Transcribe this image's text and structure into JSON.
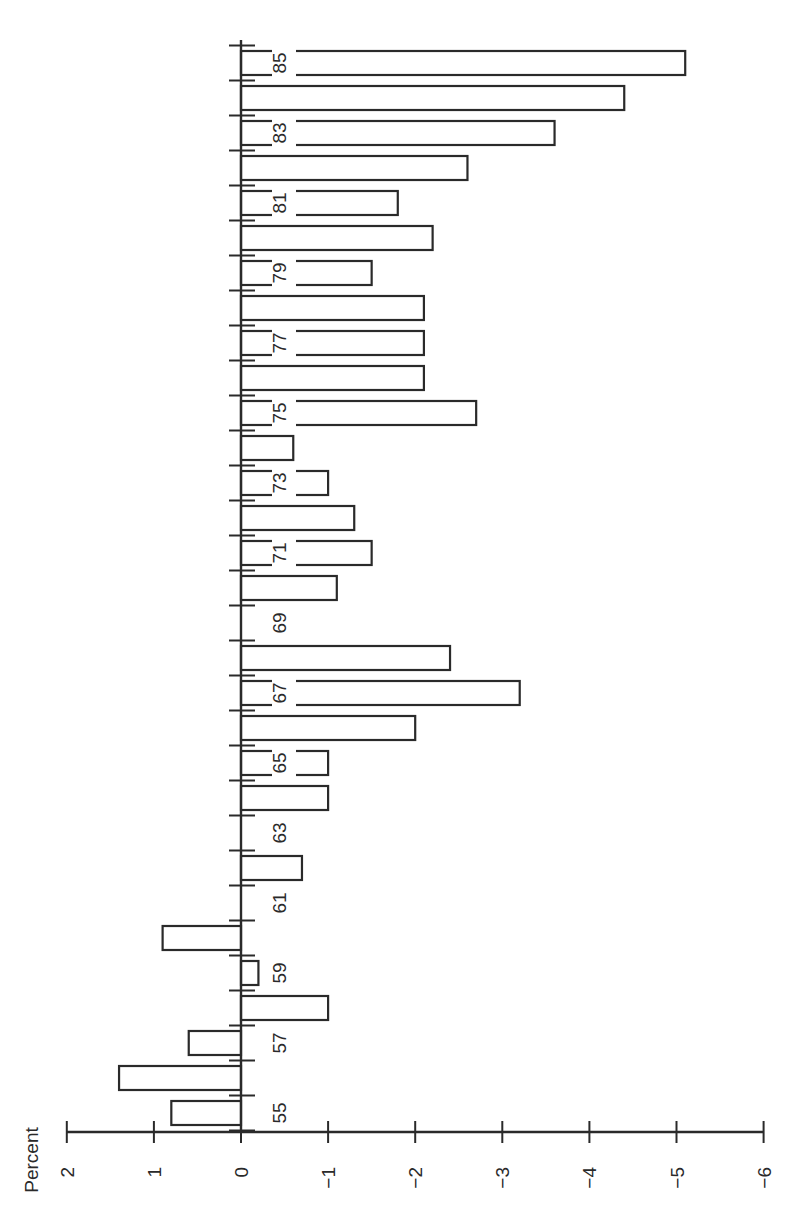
{
  "chart_data": {
    "type": "bar",
    "orientation": "horizontal (page rotated 90°)",
    "title": "",
    "ylabel": "Percent",
    "xlabel": "",
    "ylim": [
      2,
      -6
    ],
    "value_ticks": [
      2,
      1,
      0,
      -1,
      -2,
      -3,
      -4,
      -5,
      -6
    ],
    "value_tick_labels": [
      "2",
      "1",
      "0",
      "−1",
      "−2",
      "−3",
      "−4",
      "−5",
      "−6"
    ],
    "categories": [
      55,
      56,
      57,
      58,
      59,
      60,
      61,
      62,
      63,
      64,
      65,
      66,
      67,
      68,
      69,
      70,
      71,
      72,
      73,
      74,
      75,
      76,
      77,
      78,
      79,
      80,
      81,
      82,
      83,
      84,
      85
    ],
    "category_labels_shown": [
      "55",
      "57",
      "59",
      "61",
      "63",
      "65",
      "67",
      "69",
      "71",
      "73",
      "75",
      "77",
      "79",
      "81",
      "83",
      "85"
    ],
    "values": [
      0.8,
      1.4,
      0.6,
      -1.0,
      -0.2,
      0.9,
      0.0,
      -0.7,
      0.0,
      -1.0,
      -1.0,
      -2.0,
      -3.2,
      -2.4,
      0.0,
      -1.1,
      -1.5,
      -1.3,
      -1.0,
      -0.6,
      -2.7,
      -2.1,
      -2.1,
      -2.1,
      -1.5,
      -2.2,
      -1.8,
      -2.6,
      -3.6,
      -4.4,
      -5.1
    ],
    "grid": false,
    "legend": null
  }
}
